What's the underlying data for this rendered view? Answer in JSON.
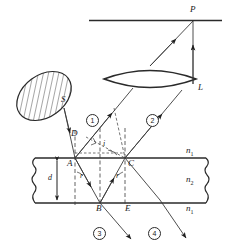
{
  "figure": {
    "stroke_color": "#2a2a2a",
    "fill_color": "#ffffff"
  },
  "labels": {
    "screen_point": "P",
    "lens": "L",
    "source": "S",
    "point_a": "A",
    "point_b": "B",
    "point_c": "C",
    "point_d": "D",
    "point_e": "E",
    "thickness": "d",
    "angle_incidence": "i",
    "angle_refraction_left": "r",
    "angle_refraction_right": "r",
    "index_above": "n",
    "index_above_sub": "1",
    "index_film": "n",
    "index_film_sub": "2",
    "index_below": "n",
    "index_below_sub": "1"
  },
  "rays": [
    {
      "id": "ray-1",
      "label": "1"
    },
    {
      "id": "ray-2",
      "label": "2"
    },
    {
      "id": "ray-3",
      "label": "3"
    },
    {
      "id": "ray-4",
      "label": "4"
    }
  ],
  "geometry": {
    "screen_y": 20,
    "slab_top_y": 158,
    "slab_bottom_y": 203,
    "point_a_x": 75,
    "point_b_x": 100,
    "point_c_x": 125,
    "point_e_x": 128,
    "screen_point_x": 193
  }
}
